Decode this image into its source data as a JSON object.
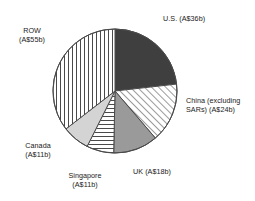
{
  "chart_data": {
    "type": "pie",
    "title": "",
    "subtitle": "",
    "xlabel": "",
    "ylabel": "",
    "units": "A$ billion",
    "total": 155,
    "legend_position": "outside-labels",
    "grid": false,
    "start_angle_deg": 0,
    "direction": "clockwise",
    "categories": [
      "U.S.",
      "China (excluding SARs)",
      "UK",
      "Singapore",
      "Canada",
      "ROW"
    ],
    "values": [
      36,
      24,
      18,
      11,
      11,
      55
    ],
    "labels": [
      "U.S. (A$36b)",
      "China (excluding\nSARs) (A$24b)",
      "UK (A$18b)",
      "Singapore\n(A$11b)",
      "Canada\n(A$11b)",
      "ROW\n(A$55b)"
    ],
    "slices": [
      {
        "name": "U.S.",
        "label": "U.S. (A$36b)",
        "value": 36,
        "fill": "solid",
        "color": "#3f3f3f",
        "start_deg": 0,
        "end_deg": 83.6
      },
      {
        "name": "China (excluding SARs)",
        "label": "China (excluding\nSARs) (A$24b)",
        "value": 24,
        "fill": "diagonal-hatch",
        "color": "#ffffff",
        "start_deg": 83.6,
        "end_deg": 139.4
      },
      {
        "name": "UK",
        "label": "UK (A$18b)",
        "value": 18,
        "fill": "solid",
        "color": "#9a9a9a",
        "start_deg": 139.4,
        "end_deg": 181.2
      },
      {
        "name": "Singapore",
        "label": "Singapore\n(A$11b)",
        "value": 11,
        "fill": "horizontal-lines",
        "color": "#ffffff",
        "start_deg": 181.2,
        "end_deg": 206.7
      },
      {
        "name": "Canada",
        "label": "Canada\n(A$11b)",
        "value": 11,
        "fill": "solid",
        "color": "#d4d4d4",
        "start_deg": 206.7,
        "end_deg": 232.3
      },
      {
        "name": "ROW",
        "label": "ROW\n(A$55b)",
        "value": 55,
        "fill": "vertical-lines",
        "color": "#ffffff",
        "start_deg": 232.3,
        "end_deg": 360
      }
    ],
    "colors": {
      "us": "#3f3f3f",
      "uk": "#9a9a9a",
      "canada": "#d4d4d4",
      "outline": "#4a4a4a",
      "background": "#ffffff",
      "text": "#1a1a1a"
    }
  }
}
